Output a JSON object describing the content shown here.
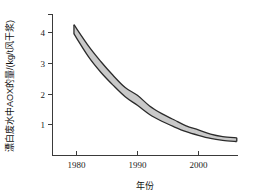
{
  "chart_data": {
    "type": "area",
    "title": "",
    "subtitle": "",
    "xlabel": "年份",
    "ylabel": "漂白废水中AOX的量/(kg/t风干浆)",
    "xlim": [
      1976,
      2006.5
    ],
    "ylim": [
      0,
      4.6
    ],
    "grid": false,
    "legend": null,
    "band_fill_color": "#c9c9c9",
    "band_edge_color": "#2b2b2b",
    "axis_color": "#3a3a3a",
    "x_ticks": [
      1980,
      1990,
      2000
    ],
    "x_tick_labels": [
      "1980",
      "1990",
      "2000"
    ],
    "y_ticks": [
      1,
      2,
      3,
      4
    ],
    "y_tick_labels": [
      "1",
      "2",
      "3",
      "4"
    ],
    "x": [
      1979.6,
      1982,
      1984,
      1986,
      1988,
      1990,
      1992,
      1994,
      1996,
      1998,
      2000,
      2002,
      2004,
      2006.3
    ],
    "series": [
      {
        "name": "上限",
        "role": "upper",
        "values": [
          4.25,
          3.55,
          3.05,
          2.6,
          2.2,
          1.95,
          1.6,
          1.35,
          1.15,
          0.95,
          0.82,
          0.68,
          0.6,
          0.56
        ]
      },
      {
        "name": "下限",
        "role": "lower",
        "values": [
          3.95,
          3.2,
          2.7,
          2.28,
          1.9,
          1.62,
          1.32,
          1.1,
          0.92,
          0.76,
          0.64,
          0.54,
          0.48,
          0.44
        ]
      }
    ],
    "annotations": []
  },
  "labels": {
    "y_axis_title": "漂白废水中AOX的量/(kg/t风干浆)",
    "x_axis_title": "年份",
    "y_tick_1": "1",
    "y_tick_2": "2",
    "y_tick_3": "3",
    "y_tick_4": "4",
    "x_tick_1980": "1980",
    "x_tick_1990": "1990",
    "x_tick_2000": "2000"
  }
}
